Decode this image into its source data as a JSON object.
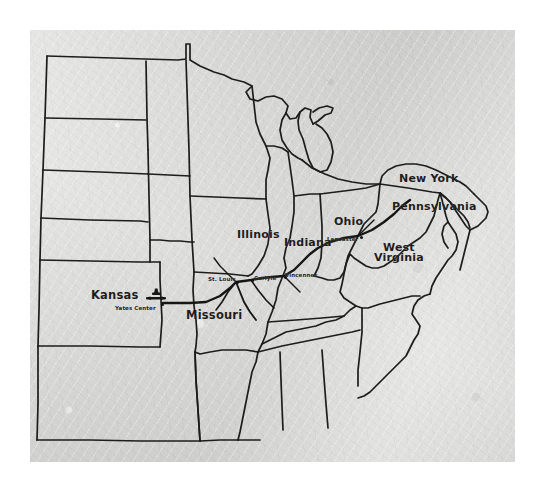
{
  "image": {
    "kind": "scanned-paper-map",
    "title": "Route map of the central and eastern United States",
    "paper_color": "#d6d6d4",
    "ink_color": "#1d1d1d",
    "background_color": "#ffffff"
  },
  "map": {
    "state_labels": [
      {
        "id": "kansas",
        "text": "Kansas",
        "x": 91,
        "y": 288
      },
      {
        "id": "missouri",
        "text": "Missouri",
        "x": 186,
        "y": 308
      },
      {
        "id": "illinois",
        "text": "Illinois",
        "x": 237,
        "y": 228
      },
      {
        "id": "indiana",
        "text": "Indiana",
        "x": 284,
        "y": 236
      },
      {
        "id": "ohio",
        "text": "Ohio",
        "x": 334,
        "y": 215
      },
      {
        "id": "pennsylvania",
        "text": "Pennsylvania",
        "x": 392,
        "y": 200
      },
      {
        "id": "new-york",
        "text": "New York",
        "x": 399,
        "y": 172
      }
    ],
    "state_labels_two_line": [
      {
        "id": "west-virginia",
        "line1": "West",
        "line2": "Virginia",
        "x": 374,
        "y": 243
      }
    ],
    "city_labels": [
      {
        "id": "yates-center",
        "text": "Yates Center",
        "x": 115,
        "y": 305,
        "dot_x": 161,
        "dot_y": 303
      },
      {
        "id": "st-louis",
        "text": "St. Louis",
        "x": 208,
        "y": 276,
        "dot_x": 236,
        "dot_y": 281
      },
      {
        "id": "carlyle",
        "text": "Carlyle",
        "x": 254,
        "y": 275,
        "dot_x": 251,
        "dot_y": 279
      },
      {
        "id": "vincennes",
        "text": "Vincennes",
        "x": 285,
        "y": 272,
        "dot_x": 284,
        "dot_y": 276
      },
      {
        "id": "lancaster",
        "text": "Lancaster",
        "x": 327,
        "y": 236,
        "dot_x": 360,
        "dot_y": 236
      }
    ],
    "route": {
      "id": "flight-route",
      "description": "Heavy route line running east from Yates Center, Kansas through St. Louis, Carlyle, Vincennes and Lancaster toward Pennsylvania",
      "stroke_width": 2.2
    },
    "aircraft_marker": {
      "id": "aircraft-symbol",
      "description": "Small dark aircraft/plane symbol drawn above Yates Center",
      "x": 155,
      "y": 294
    }
  }
}
